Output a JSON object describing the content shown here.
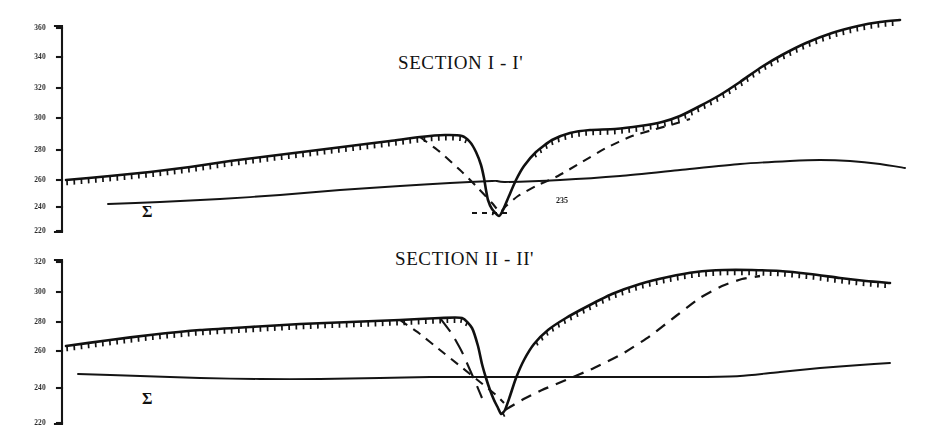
{
  "figure": {
    "background_color": "#ffffff",
    "ink_color": "#111111",
    "style": "scanned geological cross-section line drawing"
  },
  "panels": [
    {
      "id": "section-1",
      "title": "SECTION I - I'",
      "title_x": 398,
      "title_y": 52,
      "sigma_label": "Σ",
      "sigma_x": 142,
      "sigma_y": 203,
      "valley_label": "235",
      "valley_label_x": 556,
      "valley_label_y": 196,
      "axis": {
        "x": 62,
        "y_top": 26,
        "y_bottom": 232,
        "ticks": [
          {
            "label": "360",
            "y": 28
          },
          {
            "label": "340",
            "y": 57
          },
          {
            "label": "320",
            "y": 88
          },
          {
            "label": "300",
            "y": 118
          },
          {
            "label": "280",
            "y": 150
          },
          {
            "label": "260",
            "y": 180
          },
          {
            "label": "240",
            "y": 207
          },
          {
            "label": "220",
            "y": 231
          }
        ]
      }
    },
    {
      "id": "section-2",
      "title": "SECTION II - II'",
      "title_x": 395,
      "title_y": 10,
      "sigma_label": "Σ",
      "sigma_x": 142,
      "sigma_y": 152,
      "axis": {
        "x": 62,
        "y_top": 22,
        "y_bottom": 186,
        "ticks": [
          {
            "label": "320",
            "y": 24
          },
          {
            "label": "300",
            "y": 54
          },
          {
            "label": "280",
            "y": 84
          },
          {
            "label": "260",
            "y": 113
          },
          {
            "label": "240",
            "y": 150
          },
          {
            "label": "220",
            "y": 185
          }
        ]
      }
    }
  ],
  "chart_data": {
    "type": "line",
    "xlabel": "",
    "ylabel": "Elevation (m)",
    "panels": [
      {
        "name": "SECTION I - I'",
        "ylim": [
          220,
          360
        ],
        "ytick_labels": [
          "220",
          "240",
          "260",
          "280",
          "300",
          "320",
          "340",
          "360"
        ],
        "grid": false,
        "legend": "none",
        "annotations": [
          {
            "text": "Σ",
            "x": 142,
            "y": 203,
            "meaning": "sigma-unit-label"
          },
          {
            "text": "235",
            "x": 556,
            "y": 196,
            "meaning": "valley-floor-elevation"
          }
        ],
        "series": [
          {
            "name": "ground surface (hachured)",
            "style": "solid-with-hachures",
            "points": [
              [
                66,
                180
              ],
              [
                110,
                176
              ],
              [
                150,
                172
              ],
              [
                190,
                167
              ],
              [
                230,
                161
              ],
              [
                270,
                156
              ],
              [
                310,
                151
              ],
              [
                350,
                146
              ],
              [
                390,
                141
              ],
              [
                420,
                137
              ],
              [
                445,
                135
              ],
              [
                462,
                136
              ],
              [
                470,
                142
              ],
              [
                476,
                152
              ],
              [
                481,
                165
              ],
              [
                484,
                178
              ],
              [
                486,
                190
              ],
              [
                488,
                200
              ],
              [
                492,
                209
              ],
              [
                499,
                216
              ],
              [
                503,
                210
              ],
              [
                509,
                196
              ],
              [
                516,
                180
              ],
              [
                524,
                166
              ],
              [
                536,
                152
              ],
              [
                552,
                140
              ],
              [
                570,
                133
              ],
              [
                590,
                130
              ],
              [
                615,
                129
              ],
              [
                640,
                126
              ],
              [
                662,
                122
              ],
              [
                680,
                116
              ],
              [
                700,
                106
              ],
              [
                720,
                95
              ],
              [
                740,
                82
              ],
              [
                760,
                68
              ],
              [
                782,
                55
              ],
              [
                806,
                43
              ],
              [
                832,
                33
              ],
              [
                858,
                26
              ],
              [
                880,
                22
              ],
              [
                900,
                20
              ]
            ]
          },
          {
            "name": "reconstructed profile (dashed)",
            "style": "dashed",
            "points": [
              [
                420,
                137
              ],
              [
                440,
                152
              ],
              [
                460,
                170
              ],
              [
                478,
                188
              ],
              [
                492,
                203
              ],
              [
                500,
                212
              ],
              [
                506,
                206
              ],
              [
                518,
                196
              ],
              [
                536,
                186
              ],
              [
                558,
                176
              ],
              [
                582,
                162
              ],
              [
                606,
                148
              ],
              [
                632,
                136
              ],
              [
                656,
                129
              ],
              [
                674,
                124
              ],
              [
                690,
                119
              ]
            ]
          },
          {
            "name": "sub-surface horizon (solid)",
            "style": "solid",
            "points": [
              [
                108,
                204
              ],
              [
                160,
                202
              ],
              [
                220,
                199
              ],
              [
                280,
                195
              ],
              [
                340,
                190
              ],
              [
                400,
                186
              ],
              [
                450,
                183
              ],
              [
                492,
                181
              ],
              [
                497,
                181
              ],
              [
                505,
                182
              ],
              [
                560,
                180
              ],
              [
                620,
                176
              ],
              [
                680,
                170
              ],
              [
                740,
                164
              ],
              [
                790,
                161
              ],
              [
                820,
                160
              ],
              [
                850,
                161
              ],
              [
                880,
                164
              ],
              [
                905,
                168
              ]
            ]
          },
          {
            "name": "valley datum tick (dashed short)",
            "style": "dashed-short",
            "points": [
              [
                472,
                213
              ],
              [
                478,
                213
              ],
              [
                486,
                213
              ],
              [
                498,
                213
              ],
              [
                510,
                213
              ]
            ]
          }
        ]
      },
      {
        "name": "SECTION II - II'",
        "ylim": [
          220,
          320
        ],
        "ytick_labels": [
          "220",
          "240",
          "260",
          "280",
          "300",
          "320"
        ],
        "grid": false,
        "legend": "none",
        "annotations": [
          {
            "text": "Σ",
            "x": 142,
            "y": 152,
            "meaning": "sigma-unit-label"
          }
        ],
        "series": [
          {
            "name": "ground surface (hachured)",
            "style": "solid-with-hachures",
            "points": [
              [
                66,
                108
              ],
              [
                110,
                102
              ],
              [
                150,
                97
              ],
              [
                200,
                92
              ],
              [
                250,
                89
              ],
              [
                300,
                86
              ],
              [
                350,
                84
              ],
              [
                400,
                82
              ],
              [
                440,
                80
              ],
              [
                462,
                80
              ],
              [
                472,
                90
              ],
              [
                478,
                108
              ],
              [
                482,
                126
              ],
              [
                486,
                140
              ],
              [
                490,
                152
              ],
              [
                494,
                162
              ],
              [
                498,
                170
              ],
              [
                501,
                176
              ],
              [
                505,
                172
              ],
              [
                510,
                158
              ],
              [
                516,
                140
              ],
              [
                524,
                122
              ],
              [
                534,
                106
              ],
              [
                548,
                92
              ],
              [
                566,
                80
              ],
              [
                588,
                68
              ],
              [
                612,
                56
              ],
              [
                640,
                46
              ],
              [
                668,
                39
              ],
              [
                696,
                34
              ],
              [
                724,
                32
              ],
              [
                752,
                32
              ],
              [
                780,
                33
              ],
              [
                810,
                36
              ],
              [
                840,
                40
              ],
              [
                866,
                43
              ],
              [
                890,
                45
              ]
            ]
          },
          {
            "name": "reconstructed profile left (dashed)",
            "style": "dashed",
            "points": [
              [
                400,
                82
              ],
              [
                420,
                96
              ],
              [
                440,
                112
              ],
              [
                460,
                128
              ],
              [
                480,
                144
              ],
              [
                496,
                157
              ],
              [
                504,
                165
              ]
            ]
          },
          {
            "name": "reconstructed profile right (dashed)",
            "style": "dashed",
            "points": [
              [
                505,
                172
              ],
              [
                522,
                162
              ],
              [
                542,
                152
              ],
              [
                566,
                142
              ],
              [
                594,
                130
              ],
              [
                622,
                116
              ],
              [
                650,
                98
              ],
              [
                676,
                78
              ],
              [
                700,
                60
              ],
              [
                722,
                48
              ],
              [
                742,
                41
              ],
              [
                760,
                38
              ]
            ]
          },
          {
            "name": "collapse scarp left (long-dash)",
            "style": "long-dash",
            "points": [
              [
                440,
                80
              ],
              [
                452,
                96
              ],
              [
                462,
                114
              ],
              [
                470,
                132
              ],
              [
                477,
                148
              ],
              [
                482,
                160
              ]
            ]
          },
          {
            "name": "sub-surface horizon (solid)",
            "style": "solid",
            "points": [
              [
                78,
                136
              ],
              [
                140,
                138
              ],
              [
                200,
                140
              ],
              [
                260,
                141
              ],
              [
                320,
                141
              ],
              [
                380,
                140
              ],
              [
                430,
                139
              ],
              [
                470,
                139
              ],
              [
                486,
                139
              ],
              [
                500,
                139
              ],
              [
                540,
                139
              ],
              [
                600,
                139
              ],
              [
                650,
                139
              ],
              [
                700,
                139
              ],
              [
                740,
                138
              ],
              [
                780,
                134
              ],
              [
                820,
                130
              ],
              [
                860,
                127
              ],
              [
                890,
                125
              ]
            ]
          }
        ]
      }
    ]
  }
}
